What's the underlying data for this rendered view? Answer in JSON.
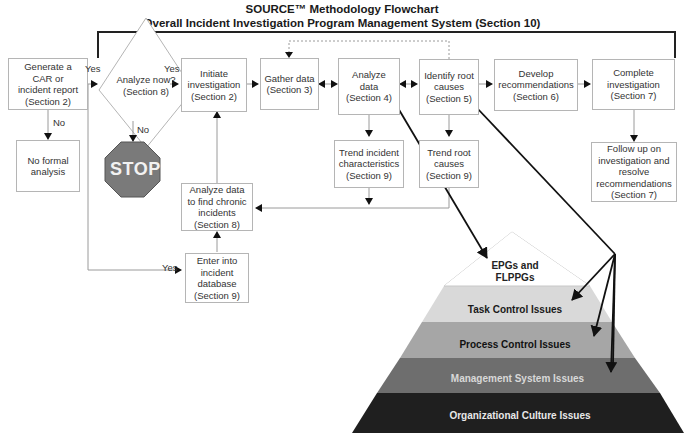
{
  "header": {
    "title": "SOURCE™ Methodology Flowchart",
    "subtitle": "Overall Incident Investigation Program Management System (Section 10)"
  },
  "nodes": {
    "generate_car": "Generate a\nCAR or\nincident report\n(Section 2)",
    "analyze_now": "Analyze now?\n(Section 8)",
    "initiate": "Initiate\ninvestigation\n(Section 2)",
    "gather": "Gather data\n(Section 3)",
    "analyze_data": "Analyze\ndata\n(Section 4)",
    "identify_root": "Identify root\ncauses\n(Section 5)",
    "develop_recs": "Develop\nrecommendations\n(Section 6)",
    "complete": "Complete\ninvestigation\n(Section 7)",
    "no_formal": "No formal\nanalysis",
    "stop": "STOP",
    "trend_incident": "Trend incident\ncharacteristics\n(Section 9)",
    "trend_root": "Trend root\ncauses\n(Section 9)",
    "follow_up": "Follow up on\ninvestigation and\nresolve\nrecommendations\n(Section 7)",
    "analyze_chronic": "Analyze data\nto find chronic\nincidents\n(Section 8)",
    "enter_db": "Enter into\nincident\ndatabase\n(Section 9)"
  },
  "edge_labels": {
    "yes_1": "Yes",
    "yes_2": "Yes",
    "yes_3": "Yes",
    "no_1": "No",
    "no_2": "No"
  },
  "pyramid": {
    "levels": [
      {
        "label": "EPGs and\nFLPPGs",
        "color": "#ffffff",
        "text_color": "#1a1a1a"
      },
      {
        "label": "Task Control Issues",
        "color": "#d9d9d9",
        "text_color": "#1a1a1a"
      },
      {
        "label": "Process Control Issues",
        "color": "#a6a6a6",
        "text_color": "#111111"
      },
      {
        "label": "Management System Issues",
        "color": "#6e6e6e",
        "text_color": "#d8d8d8"
      },
      {
        "label": "Organizational Culture Issues",
        "color": "#1f1f1f",
        "text_color": "#e8e8e8"
      }
    ]
  },
  "colors": {
    "stop_fill": "#7a7a7a",
    "box_border": "#b5b5b5",
    "connector": "#9a9a9a",
    "heavy_arrow": "#111111"
  }
}
